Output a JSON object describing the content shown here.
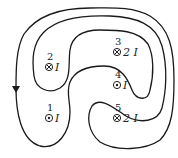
{
  "diagram": {
    "type": "ampere-loop",
    "line_color": "#1a1a1a",
    "loop_direction": "arrow pointing down on left side",
    "wires": [
      {
        "id": "1",
        "label": "1",
        "symbol": "dot",
        "symbol_meaning": "out of page",
        "current": "I",
        "x": 50,
        "y": 118
      },
      {
        "id": "2",
        "label": "2",
        "symbol": "cross",
        "symbol_meaning": "into page",
        "current": "I",
        "x": 50,
        "y": 64
      },
      {
        "id": "3",
        "label": "3",
        "symbol": "cross",
        "symbol_meaning": "into page",
        "current": "2 I",
        "x": 118,
        "y": 51
      },
      {
        "id": "4",
        "label": "4",
        "symbol": "dot",
        "symbol_meaning": "out of page",
        "current": "I",
        "x": 118,
        "y": 85
      },
      {
        "id": "5",
        "label": "5",
        "symbol": "cross",
        "symbol_meaning": "into page",
        "current": "2 I",
        "x": 118,
        "y": 118
      }
    ]
  }
}
